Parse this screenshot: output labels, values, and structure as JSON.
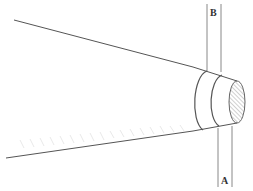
{
  "diagram": {
    "labels": {
      "top_band": "B",
      "bottom_band": "A"
    },
    "colors": {
      "stroke": "#555555",
      "light_stroke": "#9a9a9a",
      "hatch": "#8a8a8a",
      "background": "#ffffff"
    }
  }
}
